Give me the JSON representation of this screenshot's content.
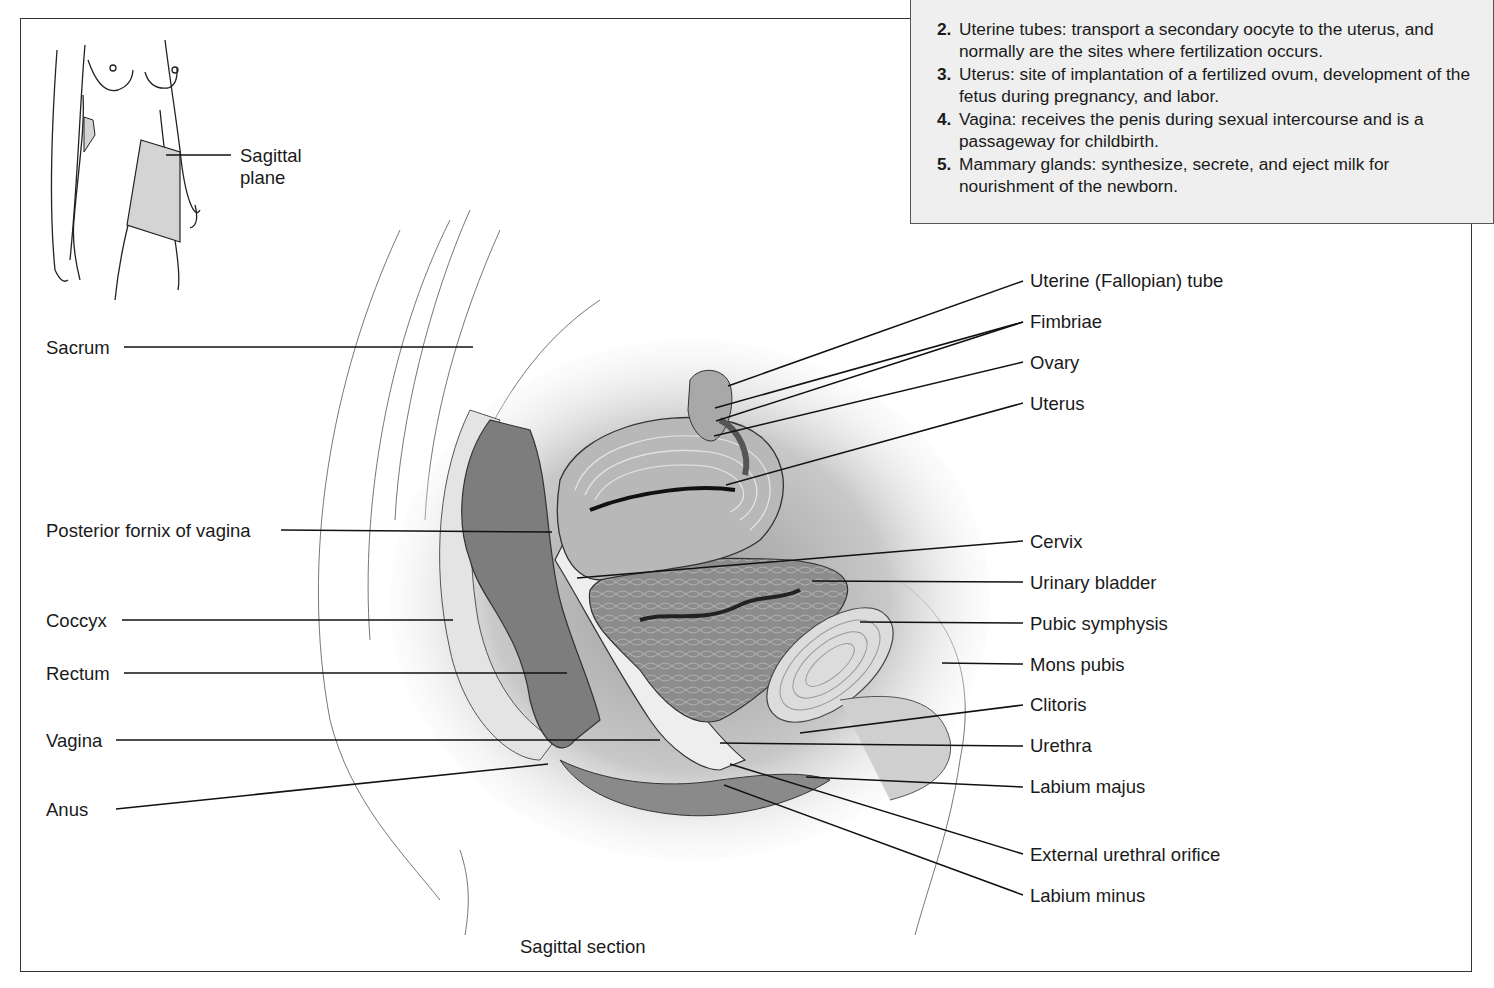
{
  "functions_box": {
    "items": [
      {
        "num": "2.",
        "text": "Uterine tubes: transport a secondary oocyte to the uterus, and normally are the sites where fertilization occurs."
      },
      {
        "num": "3.",
        "text": "Uterus: site of implantation of a fertilized ovum, development of the fetus during pregnancy, and labor."
      },
      {
        "num": "4.",
        "text": "Vagina: receives the penis during sexual intercourse and is a passageway for childbirth."
      },
      {
        "num": "5.",
        "text": "Mammary glands: synthesize, secrete, and eject milk for nourishment of the newborn."
      }
    ],
    "background": "#efefef"
  },
  "inset": {
    "label_line1": "Sagittal",
    "label_line2": "plane"
  },
  "left_labels": [
    {
      "text": "Sacrum"
    },
    {
      "text": "Posterior fornix of vagina"
    },
    {
      "text": "Coccyx"
    },
    {
      "text": "Rectum"
    },
    {
      "text": "Vagina"
    },
    {
      "text": "Anus"
    }
  ],
  "right_labels": [
    {
      "text": "Uterine (Fallopian) tube"
    },
    {
      "text": "Fimbriae"
    },
    {
      "text": "Ovary"
    },
    {
      "text": "Uterus"
    },
    {
      "text": "Cervix"
    },
    {
      "text": "Urinary bladder"
    },
    {
      "text": "Pubic symphysis"
    },
    {
      "text": "Mons pubis"
    },
    {
      "text": "Clitoris"
    },
    {
      "text": "Urethra"
    },
    {
      "text": "Labium majus"
    },
    {
      "text": "External urethral orifice"
    },
    {
      "text": "Labium minus"
    }
  ],
  "caption": "Sagittal section"
}
